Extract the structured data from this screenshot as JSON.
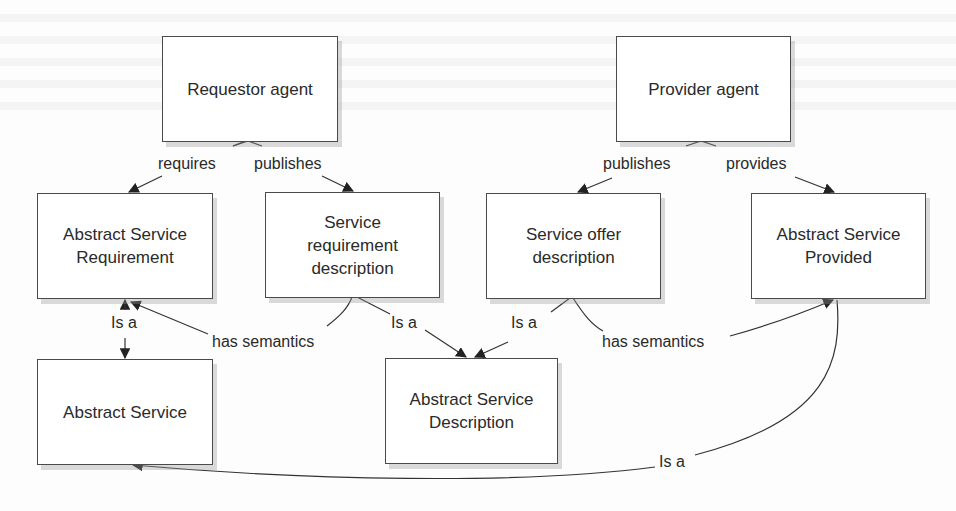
{
  "diagram": {
    "nodes": [
      {
        "id": "requestor_agent",
        "label": "Requestor agent"
      },
      {
        "id": "provider_agent",
        "label": "Provider agent"
      },
      {
        "id": "abstract_service_requirement",
        "label": "Abstract Service Requirement"
      },
      {
        "id": "service_requirement_description",
        "label": "Service requirement description"
      },
      {
        "id": "service_offer_description",
        "label": "Service offer description"
      },
      {
        "id": "abstract_service_provided",
        "label": "Abstract Service Provided"
      },
      {
        "id": "abstract_service",
        "label": "Abstract Service"
      },
      {
        "id": "abstract_service_description",
        "label": "Abstract Service Description"
      }
    ],
    "edges": [
      {
        "from": "requestor_agent",
        "to": "abstract_service_requirement",
        "label": "requires"
      },
      {
        "from": "requestor_agent",
        "to": "service_requirement_description",
        "label": "publishes"
      },
      {
        "from": "provider_agent",
        "to": "service_offer_description",
        "label": "publishes"
      },
      {
        "from": "provider_agent",
        "to": "abstract_service_provided",
        "label": "provides"
      },
      {
        "from": "abstract_service_requirement",
        "to": "abstract_service",
        "label": "Is a"
      },
      {
        "from": "service_requirement_description",
        "to": "abstract_service_requirement",
        "label": "has semantics"
      },
      {
        "from": "service_requirement_description",
        "to": "abstract_service_description",
        "label": "Is a"
      },
      {
        "from": "service_offer_description",
        "to": "abstract_service_description",
        "label": "Is a"
      },
      {
        "from": "service_offer_description",
        "to": "abstract_service_provided",
        "label": "has semantics"
      },
      {
        "from": "abstract_service_provided",
        "to": "abstract_service",
        "label": "Is a"
      }
    ]
  },
  "labels": {
    "requires": "requires",
    "publishes_left": "publishes",
    "publishes_right": "publishes",
    "provides": "provides",
    "isa_left": "Is a",
    "has_semantics_left": "has semantics",
    "isa_center_left": "Is a",
    "isa_center_right": "Is a",
    "has_semantics_right": "has semantics",
    "isa_bottom": "Is a"
  },
  "boxes": {
    "requestor_agent": "Requestor agent",
    "provider_agent": "Provider agent",
    "abstract_service_requirement": "Abstract Service Requirement",
    "service_requirement_description": "Service requirement description",
    "service_offer_description": "Service offer description",
    "abstract_service_provided": "Abstract Service Provided",
    "abstract_service": "Abstract Service",
    "abstract_service_description": "Abstract Service Description"
  },
  "colors": {
    "line": "#333333",
    "box_border": "#4a4a4a",
    "shadow": "#b0b0b0",
    "background": "#fdfdfd"
  }
}
